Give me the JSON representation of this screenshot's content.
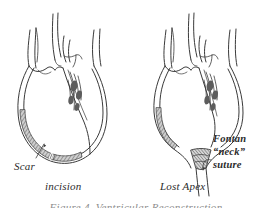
{
  "figure": {
    "type": "medical-line-drawing",
    "background_color": "#ffffff",
    "ink_color": "#333333",
    "shade_color": "#8a8a8a",
    "panels": [
      {
        "id": "left",
        "caption": "incision",
        "annotations": [
          {
            "name": "scar",
            "text": "Scar"
          }
        ]
      },
      {
        "id": "right",
        "caption": "Lost Apex",
        "annotations": [
          {
            "name": "fontan",
            "text": "Fontan"
          },
          {
            "name": "neck",
            "text": "“neck”"
          },
          {
            "name": "suture",
            "text": "suture"
          }
        ]
      }
    ],
    "bottom_cut_caption": "Figure 4. Ventricular Reconstruction"
  }
}
